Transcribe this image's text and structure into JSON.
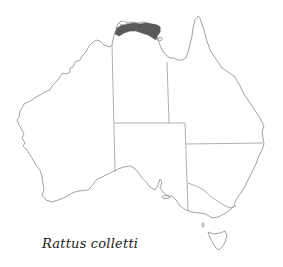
{
  "map": {
    "title": "Rattus colletti",
    "region": "Australia",
    "distribution": {
      "label": "Rattus colletti range",
      "area": "Northern Territory north coast (Top End)",
      "fill_color": "#5a5a5a"
    },
    "outline_color": "#8a8a8a",
    "border_color": "#7a7a7a",
    "states": [
      "Western Australia",
      "Northern Territory",
      "South Australia",
      "Queensland",
      "New South Wales",
      "Victoria",
      "Tasmania"
    ]
  },
  "caption": "Rattus colletti"
}
